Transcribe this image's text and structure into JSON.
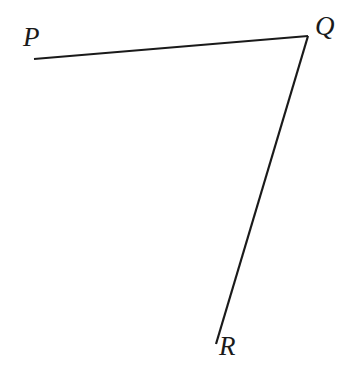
{
  "figure": {
    "type": "geometry-diagram",
    "shape_name": "angle-PQR",
    "background_color": "#ffffff",
    "stroke_color": "#1a1a1a",
    "stroke_width": 2.2,
    "width": 349,
    "height": 381
  },
  "labels": {
    "p": "P",
    "q": "Q",
    "r": "R"
  },
  "points": {
    "P": {
      "x": 34,
      "y": 59
    },
    "Q": {
      "x": 308,
      "y": 36
    },
    "R": {
      "x": 216,
      "y": 344
    }
  },
  "segments": [
    {
      "name": "segment-PQ",
      "from": "P",
      "to": "Q"
    },
    {
      "name": "segment-QR",
      "from": "Q",
      "to": "R"
    }
  ],
  "label_positions": {
    "P": {
      "x": 23,
      "y": 24
    },
    "Q": {
      "x": 315,
      "y": 13
    },
    "R": {
      "x": 219,
      "y": 333
    }
  }
}
